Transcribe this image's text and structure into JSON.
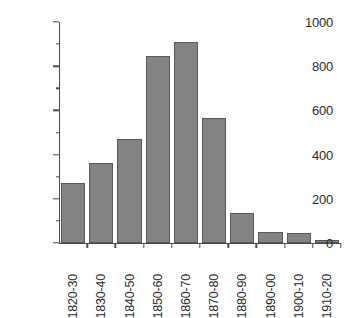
{
  "chart_data": {
    "type": "bar",
    "title": "",
    "subtitle": "",
    "xlabel": "",
    "ylabel": "",
    "categories": [
      "1820-30",
      "1830-40",
      "1840-50",
      "1850-60",
      "1860-70",
      "1870-80",
      "1880-90",
      "1890-00",
      "1900-10",
      "1910-20"
    ],
    "values": [
      270,
      362,
      470,
      845,
      910,
      565,
      136,
      52,
      45,
      15
    ],
    "ylim": [
      0,
      1000
    ],
    "y_ticks_major": [
      0,
      200,
      400,
      600,
      800,
      1000
    ],
    "y_tick_labels": [
      "0",
      "200",
      "400",
      "600",
      "800",
      "1000"
    ],
    "y_ticks_minor": [
      100,
      300,
      500,
      700,
      900
    ],
    "grid": false,
    "legend": null,
    "legend_position": "none",
    "annotations": [],
    "series": [
      {
        "name": "count",
        "values": [
          270,
          362,
          470,
          845,
          910,
          565,
          136,
          52,
          45,
          15
        ]
      }
    ]
  },
  "style": {
    "bar_fill": "#838383",
    "bar_border": "#575757",
    "axis_color": "#4a4a4a",
    "text_color": "#2b2b2b",
    "background": "#ffffff",
    "x_label_rotation": -90
  }
}
